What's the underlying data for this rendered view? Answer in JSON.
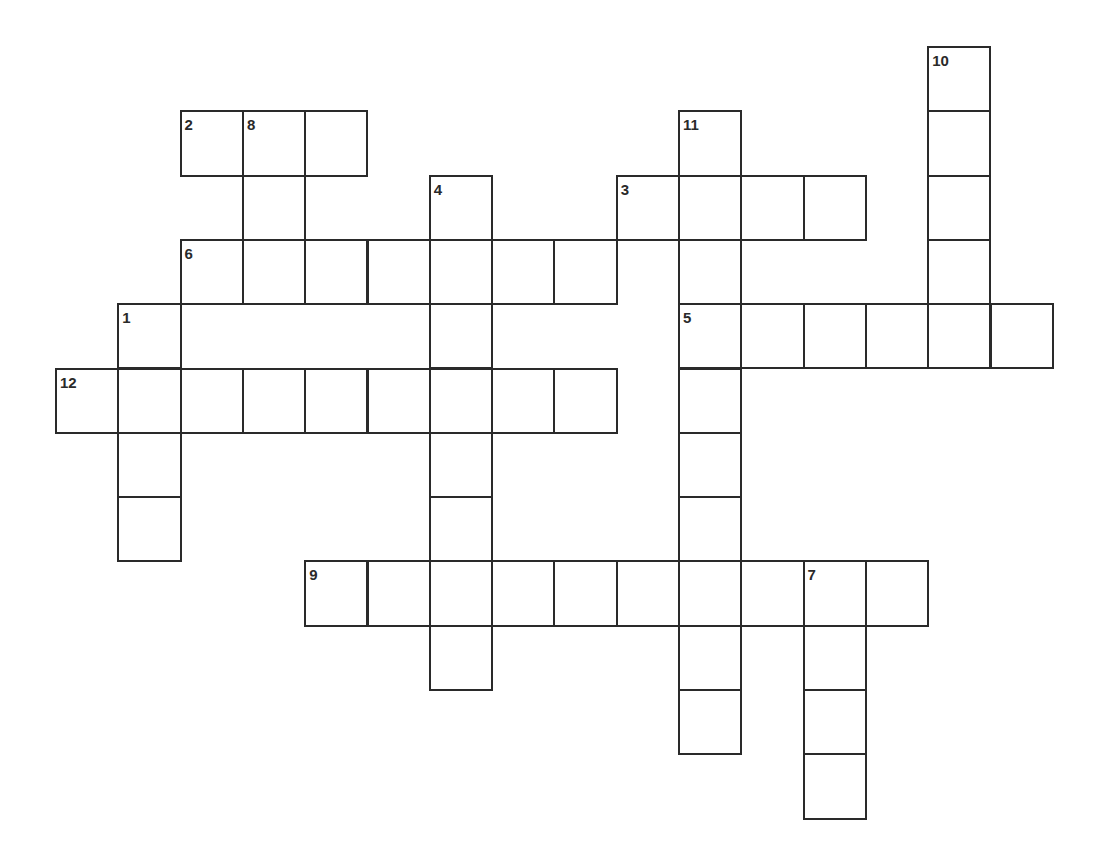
{
  "puzzle": {
    "grid": {
      "origin_x": 56,
      "origin_y": 47,
      "cell_w": 62.3,
      "cell_h": 64.3
    },
    "entries": [
      {
        "number": "1",
        "direction": "down",
        "row": 4,
        "col": 1,
        "length": 4
      },
      {
        "number": "2",
        "direction": "across",
        "row": 1,
        "col": 2,
        "length": 3
      },
      {
        "number": "3",
        "direction": "across",
        "row": 2,
        "col": 9,
        "length": 4
      },
      {
        "number": "4",
        "direction": "down",
        "row": 2,
        "col": 6,
        "length": 8
      },
      {
        "number": "5",
        "direction": "across",
        "row": 4,
        "col": 10,
        "length": 6
      },
      {
        "number": "6",
        "direction": "across",
        "row": 3,
        "col": 2,
        "length": 7
      },
      {
        "number": "7",
        "direction": "down",
        "row": 8,
        "col": 12,
        "length": 4
      },
      {
        "number": "8",
        "direction": "down",
        "row": 1,
        "col": 3,
        "length": 3
      },
      {
        "number": "9",
        "direction": "across",
        "row": 8,
        "col": 4,
        "length": 10
      },
      {
        "number": "10",
        "direction": "down",
        "row": 0,
        "col": 14,
        "length": 5
      },
      {
        "number": "11",
        "direction": "down",
        "row": 1,
        "col": 10,
        "length": 10
      },
      {
        "number": "12",
        "direction": "across",
        "row": 5,
        "col": 0,
        "length": 9
      }
    ],
    "colors": {
      "line": "#2a2a2a",
      "background": "#ffffff"
    }
  }
}
